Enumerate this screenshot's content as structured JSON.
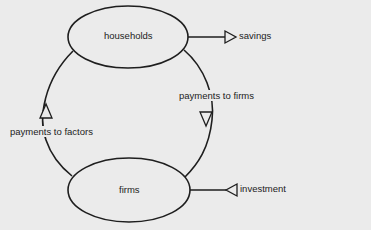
{
  "diagram": {
    "type": "circular-flow",
    "nodes": {
      "households": {
        "label": "households"
      },
      "firms": {
        "label": "firms"
      }
    },
    "flows": {
      "payments_to_firms": {
        "label": "payments to firms",
        "from": "households",
        "to": "firms"
      },
      "payments_to_factors": {
        "label": "payments to factors",
        "from": "firms",
        "to": "households"
      },
      "savings": {
        "label": "savings",
        "direction": "out",
        "node": "households"
      },
      "investment": {
        "label": "investment",
        "direction": "in",
        "node": "firms"
      }
    }
  },
  "colors": {
    "background": "#ebebeb",
    "stroke": "#1e1e1e",
    "text": "#222222"
  }
}
